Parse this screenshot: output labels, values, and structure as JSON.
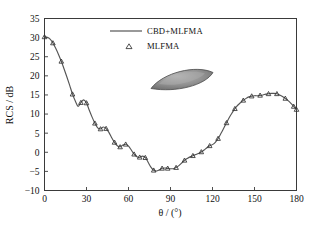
{
  "figure": {
    "background": "#ffffff",
    "frame_color": "#3a3a3a"
  },
  "axis": {
    "y_title": "RCS / dB",
    "x_title_theta": "θ",
    "x_title_units": "/ (°)",
    "x_title": "θ / (°)",
    "x_ticks": [
      "0",
      "30",
      "60",
      "90",
      "120",
      "150",
      "180"
    ],
    "y_ticks": [
      "−10",
      "−5",
      "0",
      "5",
      "10",
      "15",
      "20",
      "25",
      "30",
      "35"
    ]
  },
  "legend": {
    "entries": [
      {
        "label": "CBD+MLFMA",
        "marker": "line",
        "color": "#777777"
      },
      {
        "label": "MLFMA",
        "marker": "triangle",
        "color": "#333333"
      }
    ]
  },
  "inset": {
    "name": "almond-target-geometry",
    "fill": "#8f8f8f",
    "edge": "#4a4a4a",
    "highlight": "#b4b4b4"
  },
  "chart_data": {
    "type": "line",
    "title": "",
    "xlabel": "θ / (°)",
    "ylabel": "RCS / dB",
    "xlim": [
      0,
      180
    ],
    "ylim": [
      -10,
      35
    ],
    "xticks": [
      0,
      30,
      60,
      90,
      120,
      150,
      180
    ],
    "yticks": [
      -10,
      -5,
      0,
      5,
      10,
      15,
      20,
      25,
      30,
      35
    ],
    "grid": false,
    "legend_position": "upper-center",
    "series": [
      {
        "name": "CBD+MLFMA",
        "style": "line",
        "color": "#555555",
        "x": [
          0,
          2,
          4,
          6,
          8,
          10,
          12,
          14,
          16,
          18,
          20,
          22,
          24,
          26,
          28,
          30,
          32,
          34,
          36,
          38,
          40,
          42,
          44,
          46,
          48,
          50,
          52,
          54,
          56,
          58,
          60,
          62,
          64,
          66,
          68,
          70,
          72,
          74,
          76,
          78,
          80,
          82,
          84,
          86,
          88,
          90,
          92,
          94,
          96,
          98,
          100,
          102,
          104,
          106,
          108,
          110,
          112,
          114,
          116,
          118,
          120,
          122,
          124,
          126,
          128,
          130,
          132,
          134,
          136,
          138,
          140,
          142,
          144,
          146,
          148,
          150,
          152,
          154,
          156,
          158,
          160,
          162,
          164,
          166,
          168,
          170,
          172,
          174,
          176,
          178,
          180
        ],
        "y": [
          30.2,
          30.1,
          29.6,
          28.6,
          27.2,
          25.6,
          23.8,
          21.8,
          19.7,
          17.5,
          15.2,
          13.4,
          12.0,
          13.0,
          13.7,
          12.9,
          11.0,
          9.2,
          7.6,
          6.4,
          6.1,
          6.6,
          6.2,
          5.2,
          3.8,
          2.6,
          1.7,
          1.4,
          1.9,
          2.1,
          1.6,
          0.6,
          -0.5,
          -1.2,
          -1.3,
          -1.0,
          -1.4,
          -2.6,
          -3.9,
          -4.7,
          -4.9,
          -4.6,
          -4.2,
          -4.1,
          -4.2,
          -4.3,
          -4.3,
          -4.0,
          -3.5,
          -2.8,
          -2.1,
          -1.6,
          -1.2,
          -0.9,
          -0.6,
          -0.3,
          0.1,
          0.6,
          1.2,
          1.7,
          2.0,
          2.6,
          3.6,
          4.9,
          6.3,
          7.7,
          9.1,
          10.3,
          11.4,
          12.3,
          13.0,
          13.6,
          14.1,
          14.5,
          14.7,
          14.8,
          14.8,
          14.9,
          15.0,
          15.2,
          15.3,
          15.4,
          15.4,
          15.3,
          15.0,
          14.6,
          14.1,
          13.5,
          12.8,
          12.0,
          11.2
        ]
      },
      {
        "name": "MLFMA",
        "style": "marker",
        "marker": "triangle",
        "color": "#333333",
        "x": [
          0,
          6,
          12,
          20,
          26,
          30,
          36,
          40,
          44,
          50,
          54,
          58,
          64,
          68,
          72,
          78,
          84,
          88,
          94,
          100,
          106,
          112,
          118,
          124,
          130,
          136,
          142,
          148,
          154,
          160,
          166,
          172,
          178,
          180
        ],
        "y": [
          30.2,
          28.6,
          23.8,
          15.2,
          13.0,
          12.9,
          7.6,
          6.1,
          6.2,
          2.6,
          1.4,
          2.1,
          -0.5,
          -1.3,
          -1.4,
          -4.7,
          -4.2,
          -4.2,
          -4.0,
          -2.1,
          -0.9,
          0.1,
          1.7,
          3.6,
          7.7,
          11.4,
          13.6,
          14.7,
          14.9,
          15.3,
          15.3,
          14.1,
          12.0,
          11.2
        ]
      }
    ]
  }
}
